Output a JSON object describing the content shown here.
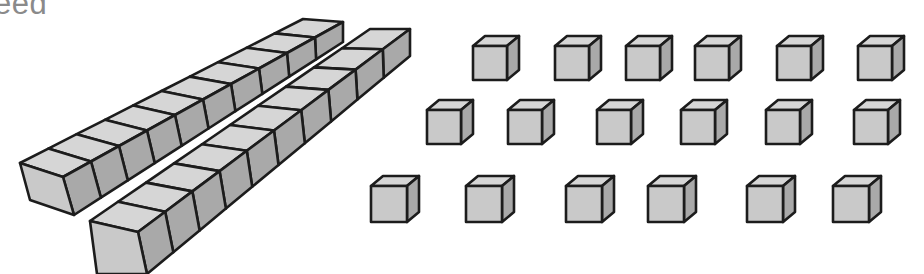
{
  "heading": {
    "text": "eed"
  },
  "illustration": {
    "description": "Base-ten blocks: two ten-rods and eighteen unit cubes",
    "colors": {
      "front": "#c9c9c9",
      "top": "#d6d6d6",
      "side": "#a9a9a9",
      "outline": "#1c1c1c"
    },
    "rods": [
      {
        "label": "ten-rod-1",
        "units": 10
      },
      {
        "label": "ten-rod-2",
        "units": 10
      }
    ],
    "unit_cube_rows": [
      {
        "row": 1,
        "count": 6,
        "y": 36,
        "xs": [
          473,
          555,
          626,
          695,
          777,
          858
        ]
      },
      {
        "row": 2,
        "count": 6,
        "y": 100,
        "xs": [
          427,
          508,
          597,
          681,
          766,
          854
        ]
      },
      {
        "row": 3,
        "count": 6,
        "y": 176,
        "xs": [
          371,
          466,
          566,
          648,
          747,
          833
        ]
      }
    ],
    "totals": {
      "tens": 2,
      "ones": 18
    }
  }
}
